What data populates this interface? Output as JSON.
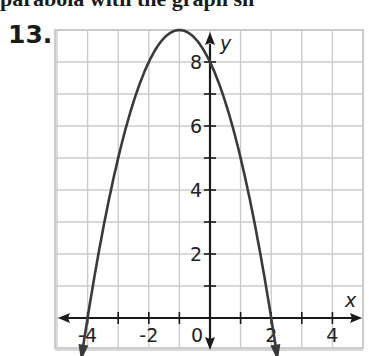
{
  "header": {
    "cut_text": "parabola with the graph sh",
    "problem_number": "13."
  },
  "chart_data": {
    "type": "line",
    "title": "",
    "xlabel": "x",
    "ylabel": "y",
    "xlim": [
      -5,
      5
    ],
    "ylim": [
      -1,
      9
    ],
    "grid": true,
    "x_tick_labels": [
      "-4",
      "-2",
      "0",
      "2",
      "4"
    ],
    "y_tick_labels": [
      "2",
      "4",
      "6",
      "8"
    ],
    "series": [
      {
        "name": "parabola",
        "equation": "y = -x^2 - 2x + 8",
        "vertex": [
          -1,
          9
        ],
        "x_intercepts": [
          -4,
          2
        ],
        "y_intercept": 8,
        "x": [
          -4.2,
          -4,
          -3,
          -2,
          -1,
          0,
          1,
          2,
          2.2
        ],
        "values": [
          -0.84,
          0,
          5,
          8,
          9,
          8,
          5,
          0,
          -0.84
        ]
      }
    ]
  },
  "colors": {
    "grid": "#cccccc",
    "axis": "#1a1a1a",
    "curve": "#3a3a3a"
  }
}
